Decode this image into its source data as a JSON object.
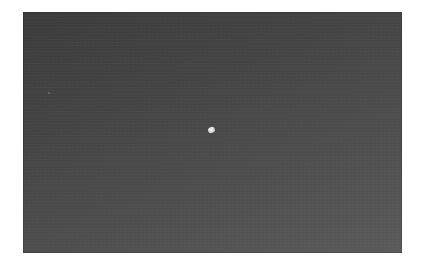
{
  "image": {
    "description": "Dark gray night-sky style photograph with a single small bright object near the center",
    "colors": {
      "page_background": "#ffffff",
      "frame_top": "#3c3c3c",
      "frame_bottom": "#5b5b5b",
      "object": "#e8e8e8"
    },
    "objects": [
      {
        "name": "bright-object",
        "x": 211,
        "y": 130
      },
      {
        "name": "faint-speck",
        "x": 49,
        "y": 93
      }
    ]
  }
}
